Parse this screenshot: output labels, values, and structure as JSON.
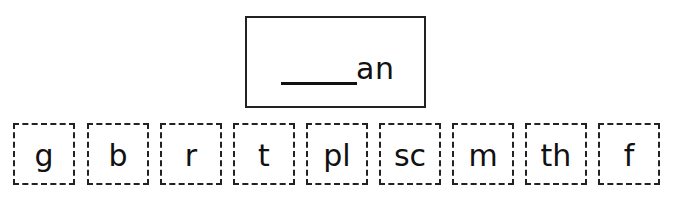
{
  "word_box": {
    "blank": "______",
    "suffix": "an"
  },
  "tiles": [
    {
      "label": "g"
    },
    {
      "label": "b"
    },
    {
      "label": "r"
    },
    {
      "label": "t"
    },
    {
      "label": "pl"
    },
    {
      "label": "sc"
    },
    {
      "label": "m"
    },
    {
      "label": "th"
    },
    {
      "label": "f"
    }
  ]
}
